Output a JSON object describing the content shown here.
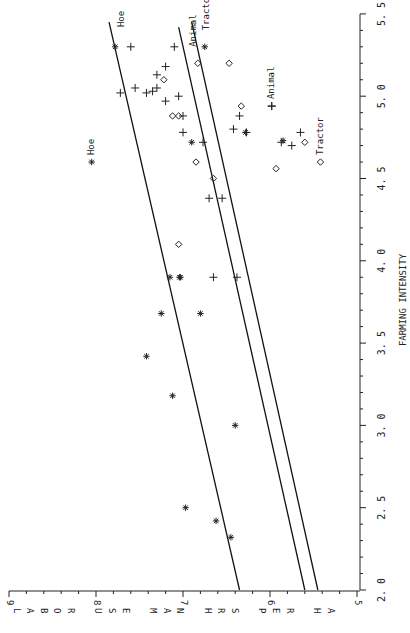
{
  "chart_data": {
    "type": "scatter",
    "orientation_note": "figure printed rotated 90 degrees clockwise",
    "title": "",
    "xlabel": "FARMING INTENSITY",
    "ylabel": "LABOR USE MAN HRS PER HA",
    "xlim": [
      2.0,
      5.5
    ],
    "ylim": [
      5,
      9
    ],
    "x_ticks": [
      "2.0",
      "2.5",
      "3.0",
      "3.5",
      "4.0",
      "4.5",
      "5.0",
      "5.5"
    ],
    "y_ticks": [
      "5",
      "6",
      "7",
      "8",
      "9"
    ],
    "grid": false,
    "legend": [
      {
        "label": "Hoe",
        "marker": "asterisk"
      },
      {
        "label": "Animal",
        "marker": "plus"
      },
      {
        "label": "Tractor",
        "marker": "diamond"
      }
    ],
    "series": [
      {
        "name": "Hoe",
        "marker": "asterisk",
        "points": [
          [
            2.32,
            6.45
          ],
          [
            2.42,
            6.62
          ],
          [
            2.5,
            6.97
          ],
          [
            3.0,
            6.4
          ],
          [
            3.18,
            7.12
          ],
          [
            3.42,
            7.42
          ],
          [
            3.68,
            7.25
          ],
          [
            3.68,
            6.8
          ],
          [
            3.9,
            7.15
          ],
          [
            3.9,
            7.03
          ],
          [
            3.9,
            7.04
          ],
          [
            4.72,
            6.9
          ],
          [
            5.3,
            7.78
          ],
          [
            5.3,
            6.75
          ],
          [
            4.78,
            6.28
          ],
          [
            4.73,
            5.85
          ]
        ]
      },
      {
        "name": "Animal",
        "marker": "plus",
        "points": [
          [
            3.9,
            6.65
          ],
          [
            3.9,
            6.38
          ],
          [
            4.38,
            6.7
          ],
          [
            4.38,
            6.55
          ],
          [
            4.72,
            6.77
          ],
          [
            4.78,
            7.0
          ],
          [
            4.88,
            7.0
          ],
          [
            4.97,
            7.2
          ],
          [
            5.0,
            7.05
          ],
          [
            5.02,
            7.42
          ],
          [
            5.03,
            7.35
          ],
          [
            5.05,
            7.3
          ],
          [
            5.05,
            7.55
          ],
          [
            5.02,
            7.72
          ],
          [
            5.13,
            7.3
          ],
          [
            5.18,
            7.2
          ],
          [
            5.3,
            7.6
          ],
          [
            5.3,
            7.1
          ],
          [
            4.8,
            6.42
          ],
          [
            4.88,
            6.35
          ],
          [
            4.78,
            6.27
          ],
          [
            4.72,
            5.87
          ],
          [
            4.7,
            5.75
          ],
          [
            4.78,
            5.65
          ],
          [
            4.94,
            5.98
          ]
        ]
      },
      {
        "name": "Tractor",
        "marker": "diamond",
        "points": [
          [
            4.1,
            7.05
          ],
          [
            4.5,
            6.65
          ],
          [
            4.6,
            6.85
          ],
          [
            4.88,
            7.12
          ],
          [
            4.88,
            7.05
          ],
          [
            5.1,
            7.22
          ],
          [
            5.2,
            6.83
          ],
          [
            5.2,
            6.47
          ],
          [
            4.94,
            6.33
          ],
          [
            4.56,
            5.93
          ],
          [
            4.72,
            5.6
          ]
        ]
      }
    ],
    "fit_lines": [
      {
        "name": "Hoe",
        "x": [
          2.0,
          5.45
        ],
        "y": [
          6.35,
          7.85
        ]
      },
      {
        "name": "Animal",
        "x": [
          2.0,
          5.42
        ],
        "y": [
          5.6,
          7.05
        ]
      },
      {
        "name": "Tractor",
        "x": [
          2.0,
          5.45
        ],
        "y": [
          5.45,
          6.9
        ]
      }
    ],
    "annotations": [
      {
        "text": "Hoe",
        "near": [
          4.6,
          8.05
        ]
      },
      {
        "text": "Animal",
        "near": [
          4.94,
          5.98
        ]
      },
      {
        "text": "Tractor",
        "near": [
          4.6,
          5.42
        ]
      },
      {
        "text": "Hoe",
        "near": [
          5.42,
          7.78
        ]
      },
      {
        "text": "Animal",
        "near": [
          5.3,
          6.95
        ]
      },
      {
        "text": "Tractor",
        "near": [
          5.4,
          6.8
        ]
      }
    ]
  }
}
